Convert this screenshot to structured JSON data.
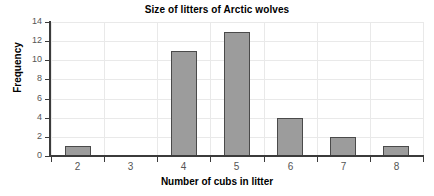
{
  "chart_data": {
    "type": "bar",
    "title": "Size of litters of Arctic wolves",
    "xlabel": "Number of cubs in litter",
    "ylabel": "Frequency",
    "categories": [
      "2",
      "3",
      "4",
      "5",
      "6",
      "7",
      "8"
    ],
    "values": [
      1,
      0,
      11,
      13,
      4,
      2,
      1
    ],
    "ylim": [
      0,
      14
    ],
    "ytick_values": [
      0,
      2,
      4,
      6,
      8,
      10,
      12,
      14
    ],
    "ytick_labels": [
      "0",
      "2",
      "4",
      "6",
      "8",
      "10",
      "12",
      "14"
    ],
    "grid": true,
    "legend": false,
    "bar_color": "#9c9c9c",
    "bar_edge_color": "#4a4a4a",
    "grid_color": "#e9e9e9",
    "axis_color": "#3b3b3b",
    "background_color": "#ffffff"
  }
}
